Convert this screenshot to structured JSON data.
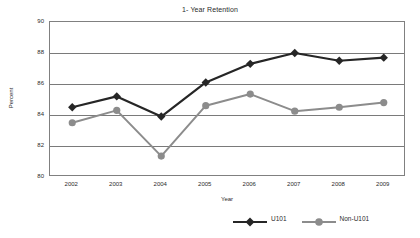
{
  "chart_data": {
    "type": "line",
    "title": "1- Year Retention",
    "xlabel": "Year",
    "ylabel": "Percent",
    "categories": [
      "2002",
      "2003",
      "2004",
      "2005",
      "2006",
      "2007",
      "2008",
      "2009"
    ],
    "x": [
      2002,
      2003,
      2004,
      2005,
      2006,
      2007,
      2008,
      2009
    ],
    "ylim": [
      80,
      90
    ],
    "yticks": [
      80,
      82,
      84,
      86,
      88,
      90
    ],
    "grid": "horizontal",
    "legend_position": "bottom",
    "series": [
      {
        "name": "U101",
        "color": "#262626",
        "marker": "diamond",
        "values": [
          84.5,
          85.2,
          83.9,
          86.1,
          87.3,
          88.0,
          87.5,
          87.7
        ]
      },
      {
        "name": "Non-U101",
        "color": "#8c8c8c",
        "marker": "circle",
        "values": [
          83.5,
          84.3,
          81.35,
          84.6,
          85.35,
          84.25,
          84.5,
          84.8
        ]
      }
    ]
  },
  "legend": {
    "items": [
      {
        "label": "U101"
      },
      {
        "label": "Non-U101"
      }
    ]
  },
  "colors": {
    "series_primary": "#262626",
    "series_secondary": "#8c8c8c",
    "axis": "#808080",
    "grid": "#7a7a7a",
    "text": "#2b2b2b",
    "background": "#ffffff"
  }
}
